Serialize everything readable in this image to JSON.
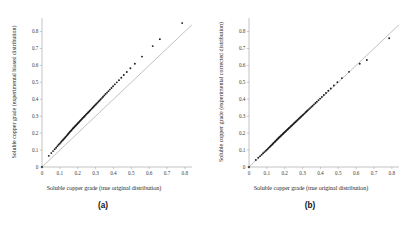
{
  "figure": {
    "panels": [
      {
        "id": "a",
        "caption": "(a)",
        "xlabel": "Soluble copper grade (true original distribution)",
        "ylabel": "Soluble copper grade (experimental biased distribution)"
      },
      {
        "id": "b",
        "caption": "(b)",
        "xlabel": "Soluble copper grade (true original distribution)",
        "ylabel": "Soluble copper grade (experimental corrected distribution)"
      }
    ]
  },
  "chart_data": [
    {
      "type": "scatter",
      "title": "",
      "panel": "(a)",
      "xlabel": "Soluble copper grade (true original distribution)",
      "ylabel": "Soluble copper grade (experimental biased distribution)",
      "xlim": [
        0,
        0.84
      ],
      "ylim": [
        0,
        0.88
      ],
      "xticks": [
        0,
        0.1,
        0.2,
        0.3,
        0.4,
        0.5,
        0.6,
        0.7,
        0.8
      ],
      "yticks": [
        0,
        0.1,
        0.2,
        0.3,
        0.4,
        0.5,
        0.6,
        0.7,
        0.8
      ],
      "xticklabels": [
        "0",
        "0.1",
        "0.2",
        "0.3",
        "0.4",
        "0.5",
        "0.6",
        "0.7",
        "0.8"
      ],
      "yticklabels": [
        "0",
        "0.1",
        "0.2",
        "0.3",
        "0.4",
        "0.5",
        "0.6",
        "0.7",
        "0.8"
      ],
      "grid": false,
      "legend": "none",
      "reference_line": {
        "name": "y = x",
        "x": [
          0,
          0.84
        ],
        "y": [
          0,
          0.84
        ]
      },
      "series": [
        {
          "name": "Q-Q quantile pairs (biased)",
          "x": [
            0.0,
            0.038,
            0.052,
            0.062,
            0.071,
            0.079,
            0.086,
            0.093,
            0.099,
            0.105,
            0.11,
            0.116,
            0.121,
            0.126,
            0.131,
            0.135,
            0.14,
            0.144,
            0.148,
            0.152,
            0.156,
            0.16,
            0.164,
            0.168,
            0.172,
            0.176,
            0.18,
            0.184,
            0.188,
            0.192,
            0.196,
            0.2,
            0.204,
            0.208,
            0.212,
            0.216,
            0.22,
            0.224,
            0.228,
            0.233,
            0.237,
            0.241,
            0.246,
            0.25,
            0.255,
            0.259,
            0.264,
            0.269,
            0.274,
            0.279,
            0.284,
            0.289,
            0.294,
            0.3,
            0.305,
            0.311,
            0.317,
            0.323,
            0.329,
            0.336,
            0.342,
            0.349,
            0.356,
            0.364,
            0.372,
            0.38,
            0.389,
            0.398,
            0.408,
            0.419,
            0.431,
            0.444,
            0.458,
            0.475,
            0.495,
            0.52,
            0.56,
            0.62,
            0.66,
            0.785
          ],
          "y": [
            0.0,
            0.066,
            0.082,
            0.094,
            0.105,
            0.114,
            0.123,
            0.131,
            0.138,
            0.145,
            0.152,
            0.158,
            0.164,
            0.17,
            0.176,
            0.181,
            0.187,
            0.192,
            0.197,
            0.202,
            0.207,
            0.212,
            0.216,
            0.221,
            0.226,
            0.23,
            0.235,
            0.239,
            0.244,
            0.248,
            0.253,
            0.257,
            0.262,
            0.266,
            0.271,
            0.275,
            0.28,
            0.284,
            0.289,
            0.294,
            0.298,
            0.303,
            0.308,
            0.313,
            0.318,
            0.323,
            0.328,
            0.334,
            0.339,
            0.345,
            0.35,
            0.356,
            0.362,
            0.368,
            0.374,
            0.38,
            0.387,
            0.393,
            0.4,
            0.408,
            0.415,
            0.423,
            0.431,
            0.439,
            0.448,
            0.457,
            0.467,
            0.477,
            0.488,
            0.5,
            0.513,
            0.527,
            0.543,
            0.561,
            0.583,
            0.61,
            0.652,
            0.714,
            0.755,
            0.85
          ]
        }
      ]
    },
    {
      "type": "scatter",
      "title": "",
      "panel": "(b)",
      "xlabel": "Soluble copper grade (true original distribution)",
      "ylabel": "Soluble copper grade (experimental corrected distribution)",
      "xlim": [
        0,
        0.84
      ],
      "ylim": [
        0,
        0.88
      ],
      "xticks": [
        0,
        0.1,
        0.2,
        0.3,
        0.4,
        0.5,
        0.6,
        0.7,
        0.8
      ],
      "yticks": [
        0,
        0.1,
        0.2,
        0.3,
        0.4,
        0.5,
        0.6,
        0.7,
        0.8
      ],
      "xticklabels": [
        "0",
        "0.1",
        "0.2",
        "0.3",
        "0.4",
        "0.5",
        "0.6",
        "0.7",
        "0.8"
      ],
      "yticklabels": [
        "0",
        "0.1",
        "0.2",
        "0.3",
        "0.4",
        "0.5",
        "0.6",
        "0.7",
        "0.8"
      ],
      "grid": false,
      "legend": "none",
      "reference_line": {
        "name": "y = x",
        "x": [
          0,
          0.84
        ],
        "y": [
          0,
          0.84
        ]
      },
      "series": [
        {
          "name": "Q-Q quantile pairs (corrected)",
          "x": [
            0.0,
            0.038,
            0.052,
            0.062,
            0.071,
            0.079,
            0.086,
            0.093,
            0.099,
            0.105,
            0.11,
            0.116,
            0.121,
            0.126,
            0.131,
            0.135,
            0.14,
            0.144,
            0.148,
            0.152,
            0.156,
            0.16,
            0.164,
            0.168,
            0.172,
            0.176,
            0.18,
            0.184,
            0.188,
            0.192,
            0.196,
            0.2,
            0.204,
            0.208,
            0.212,
            0.216,
            0.22,
            0.224,
            0.228,
            0.233,
            0.237,
            0.241,
            0.246,
            0.25,
            0.255,
            0.259,
            0.264,
            0.269,
            0.274,
            0.279,
            0.284,
            0.289,
            0.294,
            0.3,
            0.305,
            0.311,
            0.317,
            0.323,
            0.329,
            0.336,
            0.342,
            0.349,
            0.356,
            0.364,
            0.372,
            0.38,
            0.389,
            0.398,
            0.408,
            0.419,
            0.431,
            0.444,
            0.458,
            0.475,
            0.495,
            0.52,
            0.56,
            0.62,
            0.66,
            0.785
          ],
          "y": [
            0.0,
            0.042,
            0.055,
            0.064,
            0.073,
            0.081,
            0.088,
            0.095,
            0.101,
            0.107,
            0.113,
            0.118,
            0.124,
            0.129,
            0.134,
            0.139,
            0.144,
            0.148,
            0.153,
            0.157,
            0.161,
            0.166,
            0.17,
            0.174,
            0.178,
            0.182,
            0.186,
            0.19,
            0.194,
            0.198,
            0.202,
            0.206,
            0.21,
            0.214,
            0.218,
            0.222,
            0.226,
            0.23,
            0.234,
            0.239,
            0.243,
            0.247,
            0.252,
            0.256,
            0.261,
            0.265,
            0.27,
            0.275,
            0.28,
            0.285,
            0.29,
            0.295,
            0.3,
            0.306,
            0.311,
            0.317,
            0.323,
            0.329,
            0.335,
            0.342,
            0.348,
            0.355,
            0.362,
            0.37,
            0.378,
            0.386,
            0.395,
            0.404,
            0.414,
            0.425,
            0.437,
            0.45,
            0.464,
            0.481,
            0.501,
            0.525,
            0.562,
            0.61,
            0.632,
            0.76
          ]
        }
      ]
    }
  ]
}
